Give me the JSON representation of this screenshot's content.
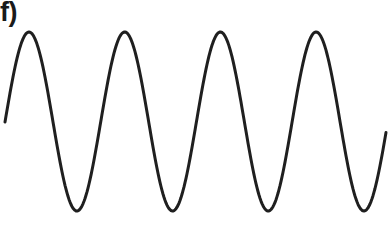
{
  "figure": {
    "panel_label": "f)",
    "waveform": {
      "type": "sine",
      "stroke_color": "#1f1f1f",
      "stroke_width": 3,
      "cycles": 4,
      "x_start": 5,
      "x_end": 386,
      "center_y": 121.5,
      "amplitude": 89.5,
      "period_px": 95.7,
      "first_peak_x": 29,
      "peaks_x": [
        29,
        122,
        218,
        312
      ],
      "troughs_x": [
        75,
        170,
        266,
        362
      ]
    }
  }
}
